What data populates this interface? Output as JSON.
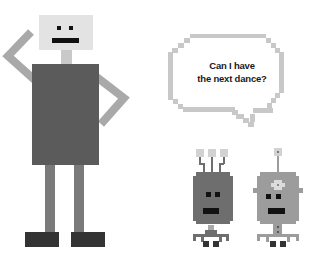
{
  "scene": {
    "description": "Pixel-art illustration of a tall robot waving and two small robots, one asking a question",
    "speech_bubble": {
      "line1": "Can I have",
      "line2": "the next dance?"
    }
  },
  "colors": {
    "background": "#ffffff",
    "big_robot_head": "#e3e3e3",
    "big_robot_body": "#5b5b5b",
    "big_robot_limbs": "#a9a9a9",
    "big_robot_legs": "#7a7a7a",
    "big_robot_feet": "#333333",
    "bubble_outline": "#c8c8c8",
    "small_robot_1": "#6e6e6e",
    "small_robot_2": "#9c9c9c",
    "accent_light": "#d2d2d2",
    "features": "#111111"
  },
  "characters": [
    {
      "name": "tall-robot",
      "pose": "waving"
    },
    {
      "name": "small-robot-three-antennas"
    },
    {
      "name": "small-robot-single-antenna"
    }
  ]
}
